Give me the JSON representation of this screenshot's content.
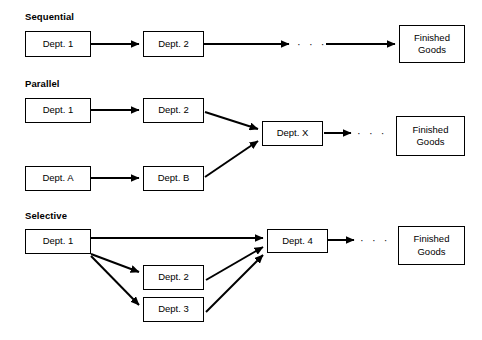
{
  "diagram": {
    "title_visible": false,
    "background_color": "#ffffff",
    "line_color": "#000000",
    "sections": [
      {
        "id": "sequential",
        "label": "Sequential",
        "label_pos": {
          "x": 25,
          "y": 11
        },
        "boxes": [
          {
            "id": "seq-dept-1",
            "name": "dept-1-box",
            "text": "Dept. 1",
            "x": 25,
            "y": 31,
            "w": 66,
            "h": 26
          },
          {
            "id": "seq-dept-2",
            "name": "dept-2-box",
            "text": "Dept. 2",
            "x": 143,
            "y": 31,
            "w": 61,
            "h": 26
          },
          {
            "id": "seq-finished-goods",
            "name": "finished-goods-box",
            "text": "Finished\nGoods",
            "x": 399,
            "y": 25,
            "w": 66,
            "h": 38
          }
        ],
        "ellipsis": [
          {
            "id": "seq-ellipsis",
            "text": "· · ·",
            "x": 297,
            "y": 38
          }
        ],
        "arrows": [
          {
            "id": "seq-a1",
            "from": "dept-1",
            "to": "dept-2",
            "x1": 91,
            "y1": 44,
            "x2": 141,
            "y2": 44
          },
          {
            "id": "seq-a2",
            "from": "dept-2",
            "to": "ellipsis",
            "x1": 204,
            "y1": 44,
            "x2": 291,
            "y2": 44
          },
          {
            "id": "seq-a3",
            "from": "ellipsis",
            "to": "finished-goods",
            "x1": 327,
            "y1": 44,
            "x2": 397,
            "y2": 44
          }
        ]
      },
      {
        "id": "parallel",
        "label": "Parallel",
        "label_pos": {
          "x": 25,
          "y": 78
        },
        "boxes": [
          {
            "id": "par-dept-1",
            "name": "dept-1-box",
            "text": "Dept. 1",
            "x": 25,
            "y": 98,
            "w": 66,
            "h": 25
          },
          {
            "id": "par-dept-2",
            "name": "dept-2-box",
            "text": "Dept. 2",
            "x": 143,
            "y": 98,
            "w": 61,
            "h": 25
          },
          {
            "id": "par-dept-a",
            "name": "dept-a-box",
            "text": "Dept. A",
            "x": 25,
            "y": 166,
            "w": 66,
            "h": 25
          },
          {
            "id": "par-dept-b",
            "name": "dept-b-box",
            "text": "Dept. B",
            "x": 143,
            "y": 166,
            "w": 61,
            "h": 25
          },
          {
            "id": "par-dept-x",
            "name": "dept-x-box",
            "text": "Dept. X",
            "x": 262,
            "y": 121,
            "w": 61,
            "h": 25
          },
          {
            "id": "par-finished-goods",
            "name": "finished-goods-box",
            "text": "Finished\nGoods",
            "x": 396,
            "y": 116,
            "w": 69,
            "h": 40
          }
        ],
        "ellipsis": [
          {
            "id": "par-ellipsis",
            "text": "· · ·",
            "x": 359,
            "y": 127
          }
        ],
        "arrows": [
          {
            "id": "par-a1",
            "from": "dept-1",
            "to": "dept-2",
            "x1": 91,
            "y1": 110,
            "x2": 141,
            "y2": 110
          },
          {
            "id": "par-a2",
            "from": "dept-2",
            "to": "dept-x",
            "x1": 205,
            "y1": 112,
            "x2": 260,
            "y2": 129
          },
          {
            "id": "par-a3",
            "from": "dept-a",
            "to": "dept-b",
            "x1": 91,
            "y1": 178,
            "x2": 141,
            "y2": 178
          },
          {
            "id": "par-a4",
            "from": "dept-b",
            "to": "dept-x",
            "x1": 205,
            "y1": 177,
            "x2": 260,
            "y2": 140
          },
          {
            "id": "par-a5",
            "from": "dept-x",
            "to": "ellipsis",
            "x1": 324,
            "y1": 133,
            "x2": 353,
            "y2": 133
          }
        ]
      },
      {
        "id": "selective",
        "label": "Selective",
        "label_pos": {
          "x": 25,
          "y": 210
        },
        "boxes": [
          {
            "id": "sel-dept-1",
            "name": "dept-1-box",
            "text": "Dept. 1",
            "x": 25,
            "y": 229,
            "w": 66,
            "h": 25
          },
          {
            "id": "sel-dept-2",
            "name": "dept-2-box",
            "text": "Dept. 2",
            "x": 143,
            "y": 265,
            "w": 61,
            "h": 25
          },
          {
            "id": "sel-dept-3",
            "name": "dept-3-box",
            "text": "Dept. 3",
            "x": 143,
            "y": 297,
            "w": 61,
            "h": 25
          },
          {
            "id": "sel-dept-4",
            "name": "dept-4-box",
            "text": "Dept. 4",
            "x": 267,
            "y": 229,
            "w": 61,
            "h": 24
          },
          {
            "id": "sel-finished-goods",
            "name": "finished-goods-box",
            "text": "Finished\nGoods",
            "x": 398,
            "y": 226,
            "w": 67,
            "h": 39
          }
        ],
        "ellipsis": [
          {
            "id": "sel-ellipsis",
            "text": "· · ·",
            "x": 362,
            "y": 235
          }
        ],
        "arrows": [
          {
            "id": "sel-a1",
            "from": "dept-1",
            "to": "dept-4",
            "x1": 91,
            "y1": 238,
            "x2": 265,
            "y2": 238
          },
          {
            "id": "sel-a2",
            "from": "dept-1",
            "to": "dept-2",
            "x1": 91,
            "y1": 254,
            "x2": 141,
            "y2": 272
          },
          {
            "id": "sel-a3",
            "from": "dept-1",
            "to": "dept-3",
            "x1": 91,
            "y1": 256,
            "x2": 141,
            "y2": 305
          },
          {
            "id": "sel-a4",
            "from": "dept-2",
            "to": "dept-4",
            "x1": 206,
            "y1": 280,
            "x2": 265,
            "y2": 248
          },
          {
            "id": "sel-a5",
            "from": "dept-3",
            "to": "dept-4",
            "x1": 206,
            "y1": 312,
            "x2": 265,
            "y2": 256
          }
        ]
      }
    ]
  }
}
